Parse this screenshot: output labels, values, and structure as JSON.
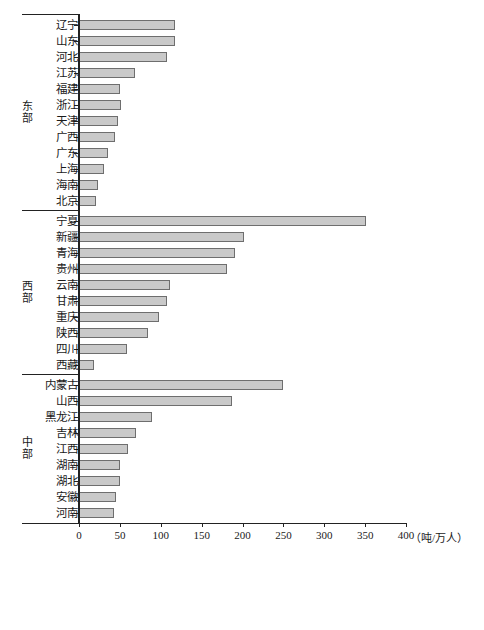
{
  "chart_data": {
    "type": "bar",
    "orientation": "horizontal",
    "title": "",
    "xlabel": "（吨/万人）",
    "ylabel": "",
    "xlim": [
      0,
      400
    ],
    "xticks": [
      0,
      50,
      100,
      150,
      200,
      250,
      300,
      350,
      400
    ],
    "xticklabels": [
      "0",
      "50",
      "100",
      "150",
      "200",
      "250",
      "300",
      "350",
      "400"
    ],
    "grid": false,
    "legend": null,
    "groups": [
      {
        "name": "东部",
        "categories": [
          "辽宁",
          "山东",
          "河北",
          "江苏",
          "福建",
          "浙江",
          "天津",
          "广西",
          "广东",
          "上海",
          "海南",
          "北京"
        ],
        "values": [
          118,
          118,
          108,
          69,
          50,
          51,
          48,
          44,
          36,
          31,
          23,
          21
        ]
      },
      {
        "name": "西部",
        "categories": [
          "宁夏",
          "新疆",
          "青海",
          "贵州",
          "云南",
          "甘肃",
          "重庆",
          "陕西",
          "四川",
          "西藏"
        ],
        "values": [
          351,
          202,
          191,
          181,
          111,
          108,
          98,
          84,
          59,
          18
        ]
      },
      {
        "name": "中部",
        "categories": [
          "内蒙古",
          "山西",
          "黑龙江",
          "吉林",
          "江西",
          "湖南",
          "湖北",
          "安徽",
          "河南"
        ],
        "values": [
          250,
          187,
          89,
          70,
          60,
          50,
          50,
          45,
          43
        ]
      }
    ],
    "colors": {
      "bar_fill": "#c9c9c9",
      "bar_border": "#6e6e6e",
      "axis": "#222222",
      "background": "#ffffff"
    }
  }
}
